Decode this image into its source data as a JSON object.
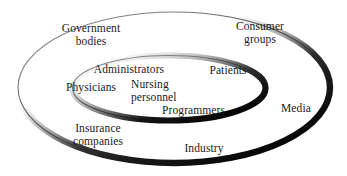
{
  "diagram": {
    "type": "concentric-ellipse-venn",
    "title": "",
    "background_color": "#ffffff",
    "text_color": "#1a1a1a",
    "shadow_color": "#111111",
    "outline_color": "#555555",
    "rings": [
      {
        "name": "outer-ring",
        "id": "outer",
        "label": "outer stakeholders"
      },
      {
        "name": "inner-ring",
        "id": "inner",
        "label": "inner stakeholders"
      }
    ],
    "labels": [
      {
        "id": "government-bodies",
        "text": "Government\nbodies",
        "ring": "outer",
        "align": "center",
        "x": 52,
        "y": 22
      },
      {
        "id": "consumer-groups",
        "text": "Consumer\ngroups",
        "ring": "outer",
        "align": "center",
        "x": 225,
        "y": 20
      },
      {
        "id": "administrators",
        "text": "Administrators",
        "ring": "inner",
        "align": "center",
        "x": 89,
        "y": 63
      },
      {
        "id": "patients",
        "text": "Patients",
        "ring": "inner",
        "align": "center",
        "x": 203,
        "y": 64
      },
      {
        "id": "physicians",
        "text": "Physicians",
        "ring": "inner",
        "align": "left",
        "x": 66,
        "y": 81
      },
      {
        "id": "nursing-personnel",
        "text": "Nursing\npersonnel",
        "ring": "inner",
        "align": "left",
        "x": 131,
        "y": 78
      },
      {
        "id": "programmers",
        "text": "Programmers",
        "ring": "inner",
        "align": "left",
        "x": 162,
        "y": 104
      },
      {
        "id": "media",
        "text": "Media",
        "ring": "outer",
        "align": "center",
        "x": 274,
        "y": 102
      },
      {
        "id": "insurance-companies",
        "text": "Insurance\ncompanies",
        "ring": "outer",
        "align": "center",
        "x": 62,
        "y": 122
      },
      {
        "id": "industry",
        "text": "Industry",
        "ring": "outer",
        "align": "center",
        "x": 179,
        "y": 142
      }
    ]
  }
}
